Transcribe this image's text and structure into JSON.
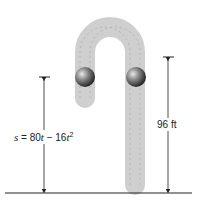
{
  "diagram": {
    "left_label": {
      "s": "s",
      "eq": " = 80",
      "t1": "t",
      "minus": " − 16",
      "t2": "t",
      "exp": "2"
    },
    "right_label": "96 ft",
    "colors": {
      "trail": "#c8c8c8",
      "ball": "#555555",
      "line": "#222222"
    }
  }
}
